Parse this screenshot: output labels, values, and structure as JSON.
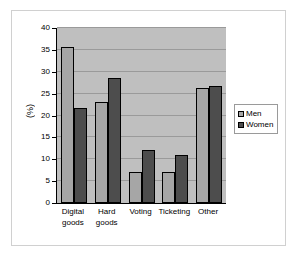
{
  "chart_data": {
    "type": "bar",
    "title": "",
    "subtitle": "",
    "xlabel": "",
    "ylabel": "(%)",
    "categories": [
      "Digital goods",
      "Hard goods",
      "Voting",
      "Ticketing",
      "Other"
    ],
    "category_lines": [
      [
        "Digital",
        "goods"
      ],
      [
        "Hard",
        "goods"
      ],
      [
        "Voting",
        ""
      ],
      [
        "Ticketing",
        ""
      ],
      [
        "Other",
        ""
      ]
    ],
    "series": [
      {
        "name": "Men",
        "color": "#a6a6a6",
        "values": [
          35.7,
          23.1,
          7.1,
          7.2,
          26.3
        ]
      },
      {
        "name": "Women",
        "color": "#4d4d4d",
        "values": [
          21.7,
          28.6,
          12.1,
          11.0,
          26.8
        ]
      }
    ],
    "ylim": [
      0,
      40
    ],
    "yticks": [
      0,
      5,
      10,
      15,
      20,
      25,
      30,
      35,
      40
    ],
    "ytick_labels": [
      "0",
      "5",
      "10",
      "15",
      "20",
      "25",
      "30",
      "35",
      "40"
    ],
    "grid": true,
    "grid_axis": "y",
    "legend_position": "right",
    "plot_background": "#bfbfbf",
    "figure_background": "#ffffff",
    "gridline_color": "#9a9a9a",
    "axis_color": "#000000",
    "bar_edge_color": "#000000"
  }
}
